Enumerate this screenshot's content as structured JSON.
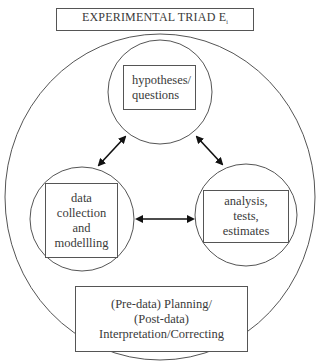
{
  "title": {
    "text": "EXPERIMENTAL TRIAD E",
    "subscript": "i"
  },
  "nodes": {
    "hypotheses": {
      "lines": [
        "hypotheses/",
        "questions"
      ]
    },
    "data": {
      "lines": [
        "data",
        "collection",
        "and",
        "modellling"
      ]
    },
    "analysis": {
      "lines": [
        "analysis,",
        "tests,",
        "estimates"
      ]
    },
    "planning": {
      "lines": [
        "(Pre-data) Planning/",
        "(Post-data)",
        "Interpretation/Correcting"
      ]
    }
  },
  "edges": [
    {
      "from": "hypotheses",
      "to": "data",
      "type": "bidirectional"
    },
    {
      "from": "hypotheses",
      "to": "analysis",
      "type": "bidirectional"
    },
    {
      "from": "data",
      "to": "analysis",
      "type": "bidirectional"
    }
  ],
  "colors": {
    "line": "#555555",
    "arrow": "#111111",
    "text": "#3a3a3a"
  }
}
